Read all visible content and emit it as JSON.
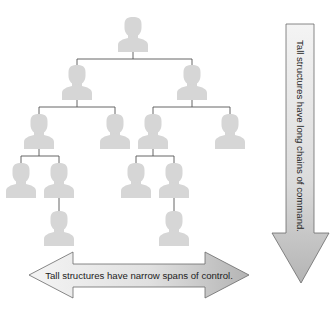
{
  "diagram": {
    "colors": {
      "person": "#d6d6d6",
      "line": "#555555",
      "arrow_fill_light": "#f2f2f2",
      "arrow_fill_dark": "#b8b8b8",
      "arrow_stroke": "#6a6a6a",
      "text": "#222222"
    },
    "nodes": [
      {
        "id": "n0",
        "level": 0,
        "x": 133,
        "y": 17
      },
      {
        "id": "n1",
        "level": 1,
        "x": 77,
        "y": 65
      },
      {
        "id": "n2",
        "level": 1,
        "x": 192,
        "y": 65
      },
      {
        "id": "n3",
        "level": 2,
        "x": 39,
        "y": 114
      },
      {
        "id": "n4",
        "level": 2,
        "x": 115,
        "y": 114
      },
      {
        "id": "n5",
        "level": 2,
        "x": 153,
        "y": 114
      },
      {
        "id": "n6",
        "level": 2,
        "x": 230,
        "y": 114
      },
      {
        "id": "n7",
        "level": 3,
        "x": 21,
        "y": 163
      },
      {
        "id": "n8",
        "level": 3,
        "x": 59,
        "y": 163
      },
      {
        "id": "n9",
        "level": 3,
        "x": 136,
        "y": 163
      },
      {
        "id": "n10",
        "level": 3,
        "x": 174,
        "y": 163
      },
      {
        "id": "n11",
        "level": 4,
        "x": 59,
        "y": 211
      },
      {
        "id": "n12",
        "level": 4,
        "x": 174,
        "y": 211
      }
    ],
    "edges": [
      [
        "n0",
        "n1"
      ],
      [
        "n0",
        "n2"
      ],
      [
        "n1",
        "n3"
      ],
      [
        "n1",
        "n4"
      ],
      [
        "n2",
        "n5"
      ],
      [
        "n2",
        "n6"
      ],
      [
        "n3",
        "n7"
      ],
      [
        "n3",
        "n8"
      ],
      [
        "n5",
        "n9"
      ],
      [
        "n5",
        "n10"
      ],
      [
        "n8",
        "n11"
      ],
      [
        "n10",
        "n12"
      ]
    ],
    "vertical_arrow": {
      "label": "Tall structures have long chains of command.",
      "direction": "down"
    },
    "horizontal_arrow": {
      "label": "Tall structures have narrow spans of control.",
      "direction": "both"
    }
  }
}
